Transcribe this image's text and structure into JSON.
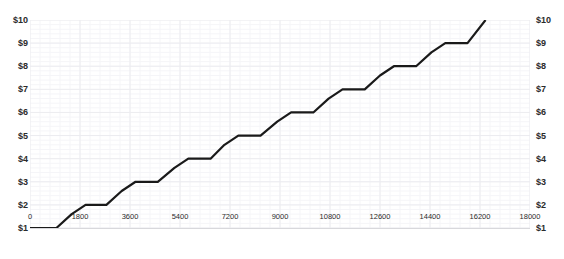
{
  "chart": {
    "title": "",
    "background_color": "#ffffff",
    "line_color": "#1a1a1a",
    "grid_color": "#ececf0",
    "text_color": "#2b2b2b"
  },
  "chart_data": {
    "type": "line",
    "title": "",
    "xlabel": "",
    "ylabel": "",
    "xlim": [
      0,
      18000
    ],
    "ylim": [
      1,
      10
    ],
    "grid": true,
    "legend": "none",
    "dual_y_axis": true,
    "x_ticks": [
      0,
      1800,
      3600,
      5400,
      7200,
      9000,
      10800,
      12600,
      14400,
      16200,
      18000
    ],
    "x_tick_labels": [
      "0",
      "1800",
      "3600",
      "5400",
      "7200",
      "9000",
      "10800",
      "12600",
      "14400",
      "16200",
      "18000"
    ],
    "y_ticks": [
      1,
      2,
      3,
      4,
      5,
      6,
      7,
      8,
      9,
      10
    ],
    "y_tick_labels_left": [
      "$1",
      "$2",
      "$3",
      "$4",
      "$5",
      "$6",
      "$7",
      "$8",
      "$9",
      "$10"
    ],
    "y_tick_labels_right": [
      "$1",
      "$2",
      "$3",
      "$4",
      "$5",
      "$6",
      "$7",
      "$8",
      "$9",
      "$10"
    ],
    "series": [
      {
        "name": "price-step-curve",
        "x": [
          0,
          950,
          1500,
          2000,
          2750,
          3300,
          3800,
          4600,
          5200,
          5700,
          6500,
          7000,
          7500,
          8300,
          8900,
          9400,
          10200,
          10750,
          11250,
          12050,
          12600,
          13100,
          13900,
          14450,
          14950,
          15750,
          16400
        ],
        "y": [
          1.0,
          1.0,
          1.6,
          2.0,
          2.0,
          2.6,
          3.0,
          3.0,
          3.6,
          4.0,
          4.0,
          4.6,
          5.0,
          5.0,
          5.6,
          6.0,
          6.0,
          6.6,
          7.0,
          7.0,
          7.6,
          8.0,
          8.0,
          8.6,
          9.0,
          9.0,
          10.0
        ]
      }
    ]
  }
}
